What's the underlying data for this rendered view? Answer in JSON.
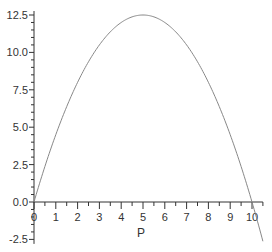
{
  "chart_data": {
    "type": "line",
    "title": "",
    "xlabel": "P",
    "ylabel": "",
    "xlim": [
      0,
      10.5
    ],
    "ylim": [
      -2.8,
      12.5
    ],
    "grid": false,
    "legend": null,
    "x_ticks": [
      "0",
      "1",
      "2",
      "3",
      "4",
      "5",
      "6",
      "7",
      "8",
      "9",
      "10"
    ],
    "y_ticks": [
      "-2.5",
      "0.0",
      "2.5",
      "5.0",
      "7.5",
      "10.0",
      "12.5"
    ],
    "series": [
      {
        "name": "curve",
        "color": "#888888",
        "x": [
          0,
          0.5,
          1,
          1.5,
          2,
          2.5,
          3,
          3.5,
          4,
          4.5,
          5,
          5.5,
          6,
          6.5,
          7,
          7.5,
          8,
          8.5,
          9,
          9.5,
          10,
          10.5
        ],
        "y": [
          0,
          2.375,
          4.5,
          6.375,
          8,
          9.375,
          10.5,
          11.375,
          12,
          12.375,
          12.5,
          12.375,
          12,
          11.375,
          10.5,
          9.375,
          8,
          6.375,
          4.5,
          2.375,
          0,
          -2.625
        ]
      }
    ]
  },
  "layout": {
    "origin_px": [
      34,
      202
    ],
    "px_per_x": 21.8,
    "px_per_y": 14.96,
    "axis_color": "#333333",
    "line_color": "#888888"
  }
}
